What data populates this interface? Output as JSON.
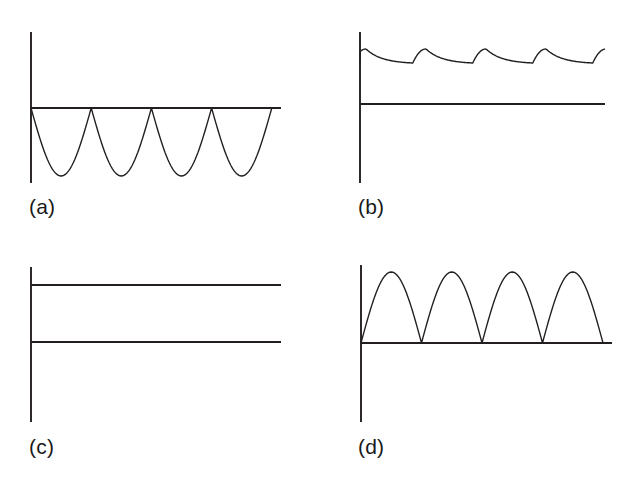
{
  "figure": {
    "title": "",
    "background_color": "#ffffff",
    "stroke_color": "#231f20",
    "axis_stroke_width": 1.9,
    "curve_stroke_width": 1.4,
    "width": 627,
    "height": 488
  },
  "panels": [
    {
      "id": "a",
      "label": "(a)",
      "description": "inverted full-wave rectified sine",
      "axes": {
        "vertical_x": 31,
        "vertical_y_top": 32,
        "vertical_y_bottom": 183,
        "horizontal_y": 108,
        "horizontal_x_start": 31,
        "horizontal_x_end": 281
      },
      "waveform": {
        "type": "rectified-sine",
        "direction": "below-axis",
        "cycles": 4,
        "period_px": 60.2,
        "amplitude_px": 68,
        "boundaries_px": [
          31,
          91.2,
          151.4,
          211.6,
          271.8
        ],
        "baseline_y": 108,
        "peak_y": 176
      }
    },
    {
      "id": "b",
      "label": "(b)",
      "description": "filtered DC with sawtooth ripple",
      "axes": {
        "vertical_x": 360,
        "vertical_y_top": 32,
        "vertical_y_bottom": 183,
        "horizontal_y": 104,
        "horizontal_x_start": 360,
        "horizontal_x_end": 605
      },
      "waveform": {
        "type": "ripple",
        "direction": "above-axis",
        "cycles": 4,
        "period_px": 60,
        "dc_level_y": 58,
        "ripple_peak_y": 49,
        "ripple_trough_y": 63,
        "start_y": 62,
        "end_x": 605
      }
    },
    {
      "id": "c",
      "label": "(c)",
      "description": "pure DC level, no ripple",
      "axes": {
        "vertical_x": 31,
        "vertical_y_top": 267,
        "vertical_y_bottom": 422,
        "horizontal_y": 342,
        "horizontal_x_start": 31,
        "horizontal_x_end": 281
      },
      "waveform": {
        "type": "constant",
        "direction": "above-axis",
        "level_y": 285,
        "x_start": 31,
        "x_end": 281
      }
    },
    {
      "id": "d",
      "label": "(d)",
      "description": "full-wave rectified sine",
      "axes": {
        "vertical_x": 361,
        "vertical_y_top": 265,
        "vertical_y_bottom": 422,
        "horizontal_y": 343,
        "horizontal_x_start": 361,
        "horizontal_x_end": 612
      },
      "waveform": {
        "type": "rectified-sine",
        "direction": "above-axis",
        "cycles": 4,
        "period_px": 60.5,
        "amplitude_px": 71,
        "boundaries_px": [
          361,
          421.5,
          482,
          542.5,
          603
        ],
        "baseline_y": 343,
        "peak_y": 272
      }
    }
  ],
  "chart_data": {
    "type": "line",
    "title": "",
    "xlabel": "",
    "ylabel": "",
    "panel_count": 4,
    "panels": [
      {
        "key": "a",
        "label": "(a)",
        "waveform": "inverted full-wave rectified sine",
        "cycles": 4,
        "amplitude": -1,
        "baseline": 0,
        "ylim": [
          -1.1,
          0.45
        ],
        "grid": false
      },
      {
        "key": "b",
        "label": "(b)",
        "waveform": "DC with ripple",
        "cycles": 4,
        "dc_level": 0.72,
        "ripple_peak": 0.8,
        "ripple_trough": 0.62,
        "ylim": [
          0,
          1.0
        ],
        "grid": false
      },
      {
        "key": "c",
        "label": "(c)",
        "waveform": "constant DC",
        "cycles": 0,
        "dc_level": 0.75,
        "ylim": [
          0,
          1.0
        ],
        "grid": false
      },
      {
        "key": "d",
        "label": "(d)",
        "waveform": "full-wave rectified sine",
        "cycles": 4,
        "amplitude": 1,
        "baseline": 0,
        "ylim": [
          0,
          1.1
        ],
        "grid": false
      }
    ]
  }
}
